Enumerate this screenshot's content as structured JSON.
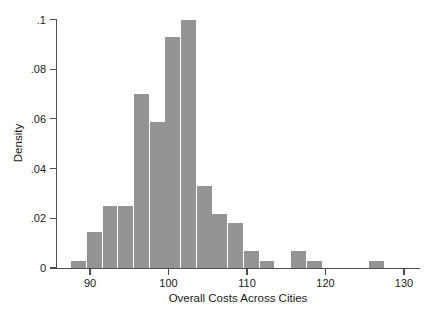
{
  "chart_data": {
    "type": "bar",
    "title": "",
    "subtitle": "",
    "xlabel": "Overall Costs Across Cities",
    "ylabel": "Density",
    "xlim": [
      87.0,
      130.0
    ],
    "ylim": [
      0,
      0.1055
    ],
    "grid": false,
    "legend": null,
    "bin_width": 2,
    "xticks": [
      90,
      100,
      110,
      120,
      130
    ],
    "xtick_labels": [
      "90",
      "100",
      "110",
      "120",
      "130"
    ],
    "yticks": [
      0,
      0.02,
      0.04,
      0.06,
      0.08,
      0.1
    ],
    "ytick_labels": [
      "0",
      ".02",
      ".04",
      ".06",
      ".08",
      ".1"
    ],
    "bar_color": "#939393",
    "bins": [
      {
        "left": 87.6,
        "right": 89.5,
        "value": 0.003
      },
      {
        "left": 89.6,
        "right": 91.5,
        "value": 0.0145
      },
      {
        "left": 91.6,
        "right": 93.5,
        "value": 0.025
      },
      {
        "left": 93.6,
        "right": 95.5,
        "value": 0.025
      },
      {
        "left": 95.6,
        "right": 97.5,
        "value": 0.07
      },
      {
        "left": 97.6,
        "right": 99.5,
        "value": 0.0587
      },
      {
        "left": 99.6,
        "right": 101.5,
        "value": 0.0928
      },
      {
        "left": 101.6,
        "right": 103.5,
        "value": 0.1
      },
      {
        "left": 103.6,
        "right": 105.5,
        "value": 0.033
      },
      {
        "left": 105.6,
        "right": 107.5,
        "value": 0.0217
      },
      {
        "left": 107.6,
        "right": 109.5,
        "value": 0.018
      },
      {
        "left": 109.6,
        "right": 111.5,
        "value": 0.007
      },
      {
        "left": 111.6,
        "right": 113.5,
        "value": 0.003
      },
      {
        "left": 115.6,
        "right": 117.5,
        "value": 0.007
      },
      {
        "left": 117.6,
        "right": 119.5,
        "value": 0.003
      },
      {
        "left": 125.6,
        "right": 127.5,
        "value": 0.003
      }
    ],
    "categories": [
      "87.6-89.5",
      "89.6-91.5",
      "91.6-93.5",
      "93.6-95.5",
      "95.6-97.5",
      "97.6-99.5",
      "99.6-101.5",
      "101.6-103.5",
      "103.6-105.5",
      "105.6-107.5",
      "107.6-109.5",
      "109.6-111.5",
      "111.6-113.5",
      "115.6-117.5",
      "117.6-119.5",
      "125.6-127.5"
    ],
    "values": [
      0.003,
      0.0145,
      0.025,
      0.025,
      0.07,
      0.0587,
      0.0928,
      0.1,
      0.033,
      0.0217,
      0.018,
      0.007,
      0.003,
      0.007,
      0.003,
      0.003
    ]
  }
}
